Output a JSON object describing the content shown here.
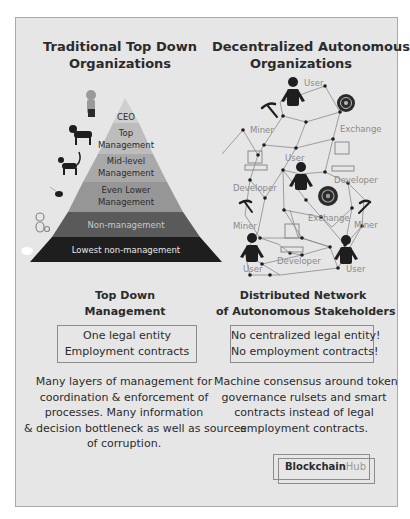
{
  "left": {
    "title_lines": [
      "Traditional Top Down",
      "Organizations"
    ],
    "pyramid": {
      "levels": [
        {
          "label_lines": [
            "CEO"
          ],
          "color": "#cfcfcf",
          "text_color": "#2b2b2b"
        },
        {
          "label_lines": [
            "Top",
            "Management"
          ],
          "color": "#bdbdbd",
          "text_color": "#2b2b2b"
        },
        {
          "label_lines": [
            "Mid-level",
            "Management"
          ],
          "color": "#a9a9a9",
          "text_color": "#2b2b2b"
        },
        {
          "label_lines": [
            "Even Lower",
            "Management"
          ],
          "color": "#969696",
          "text_color": "#2b2b2b"
        },
        {
          "label_lines": [
            "Non-management"
          ],
          "color": "#5a5a5a",
          "text_color": "#c8c8c8"
        },
        {
          "label_lines": [
            "Lowest non-management"
          ],
          "color": "#1e1e1e",
          "text_color": "#e8e8e8"
        }
      ],
      "animals": [
        "dog-sitting-icon",
        "dog-icon",
        "cat-icon",
        "bird-icon",
        "monkey-icon",
        "sheep-icon"
      ]
    },
    "subtitle_lines": [
      "Top Down",
      "Management"
    ],
    "box_lines": [
      "One legal entity",
      "Employment contracts"
    ],
    "desc_lines": [
      "Many layers of management for",
      "coordination & enforcement of",
      "processes. Many information",
      "& decision bottleneck as well as sources",
      "of corruption."
    ]
  },
  "right": {
    "title_lines": [
      "Decentralized Autonomous",
      "Organizations"
    ],
    "network": {
      "labels": {
        "user": "User",
        "miner": "Miner",
        "exchange": "Exchange",
        "developer": "Developer"
      }
    },
    "subtitle_lines": [
      "Distributed Network",
      "of Autonomous Stakeholders"
    ],
    "box_lines": [
      "No centralized legal entity!",
      "No employment contracts!"
    ],
    "desc_lines": [
      "Machine consensus around token",
      "governance rulsets and smart",
      "contracts instead of legal",
      "employment contracts."
    ]
  },
  "brand": {
    "part1": "Blockchain",
    "part2": "Hub"
  },
  "colors": {
    "panel_bg": "#e6e6e6",
    "network_line": "#8a8a8a",
    "node": "#1e1e1e",
    "label_gray": "#8a8a8a"
  }
}
